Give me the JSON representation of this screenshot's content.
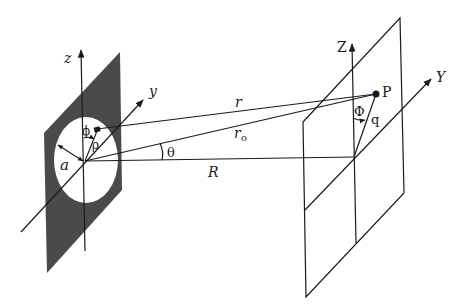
{
  "diagram": {
    "type": "aperture-diffraction-geometry",
    "colors": {
      "screen_fill": "#4a4a4a",
      "line": "#1a1a1a",
      "background": "#ffffff"
    },
    "aperture_plane": {
      "axes": {
        "z": "z",
        "y": "y"
      },
      "aperture_radius_label": "a",
      "point_angle_label": "ϕ",
      "point_radius_label": "ρ"
    },
    "observation_plane": {
      "axes": {
        "Z": "Z",
        "Y": "Y"
      },
      "point_label": "P",
      "azimuth_label": "Φ",
      "radius_label": "q"
    },
    "distances": {
      "r": "r",
      "r0": "r",
      "r0_subscript": "o",
      "R": "R"
    },
    "angle_label": "θ"
  }
}
